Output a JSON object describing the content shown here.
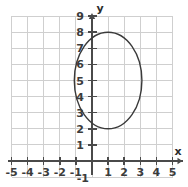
{
  "figure": {
    "width": 188,
    "height": 187,
    "background": "#ffffff"
  },
  "axes": {
    "x_label": "x",
    "y_label": "y",
    "axis_color": "#4a4a4a",
    "grid_color": "#cfcfcf",
    "tick_color": "#4a4a4a",
    "x_ticks": [
      "-5",
      "-4",
      "-3",
      "-2",
      "-1",
      "1",
      "2",
      "3",
      "4",
      "5"
    ],
    "y_ticks": [
      "9",
      "8",
      "7",
      "6",
      "5",
      "4",
      "3",
      "2",
      "1"
    ],
    "origin_label": "-1",
    "xlim": [
      -5,
      5
    ],
    "ylim": [
      -1,
      9
    ],
    "grid": true
  },
  "chart_data": {
    "type": "scatter",
    "title": "",
    "xlabel": "x",
    "ylabel": "y",
    "xlim": [
      -5,
      5
    ],
    "ylim": [
      -1,
      9
    ],
    "grid": true,
    "legend": "none",
    "x_tick_values": [
      -5,
      -4,
      -3,
      -2,
      -1,
      1,
      2,
      3,
      4,
      5
    ],
    "y_tick_values": [
      9,
      8,
      7,
      6,
      5,
      4,
      3,
      2,
      1
    ],
    "series": [
      {
        "name": "ellipse",
        "shape": "ellipse",
        "center_x": 1,
        "center_y": 5,
        "semi_axis_x": 2.1,
        "semi_axis_y": 3,
        "top_point": [
          1,
          8
        ],
        "bottom_point": [
          1,
          2
        ],
        "left_point": [
          -1.1,
          5
        ],
        "right_point": [
          3.1,
          5
        ],
        "stroke": "#3a3a3a",
        "fill": "none",
        "stroke_width": 1.4
      }
    ]
  }
}
